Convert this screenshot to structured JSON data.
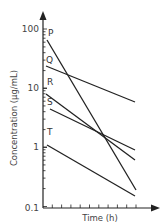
{
  "chart_data": {
    "type": "line",
    "title": "",
    "xlabel": "Time (h)",
    "ylabel": "Concentration (µg/mL)",
    "yscale": "log",
    "ylim": [
      0.1,
      100
    ],
    "yticks": [
      "100",
      "10",
      "1",
      "0.1"
    ],
    "xticks_count": 10,
    "grid": false,
    "legend": "inline labels at line starts",
    "series": [
      {
        "name": "P",
        "x": [
          0,
          10
        ],
        "values": [
          65,
          0.15
        ]
      },
      {
        "name": "Q",
        "x": [
          0,
          10
        ],
        "values": [
          23,
          5
        ]
      },
      {
        "name": "R",
        "x": [
          0,
          10
        ],
        "values": [
          7,
          0.4
        ]
      },
      {
        "name": "S",
        "x": [
          0,
          10
        ],
        "values": [
          4,
          0.8
        ]
      },
      {
        "name": "T",
        "x": [
          0,
          10
        ],
        "values": [
          1,
          0.12
        ]
      }
    ]
  },
  "axes": {
    "x_title": "Time (h)",
    "y_title": "Concentration (µg/mL)",
    "y_labels": [
      "100",
      "10",
      "1",
      "0.1"
    ]
  }
}
